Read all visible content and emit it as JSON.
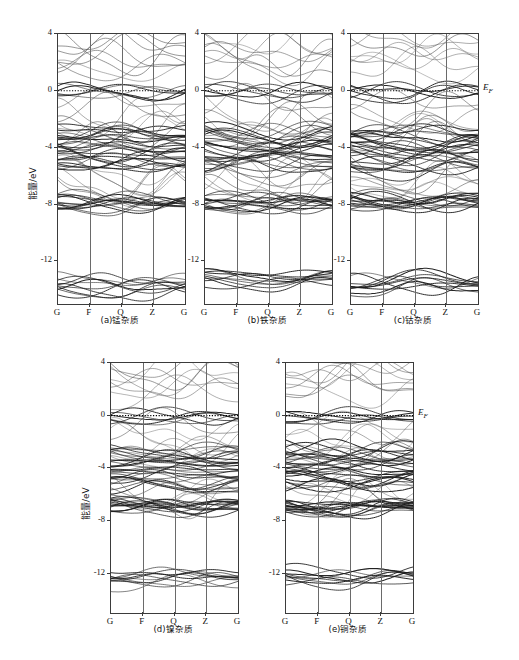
{
  "figure": {
    "ylabel": "能量/eV",
    "fermi_label_text": "E",
    "fermi_label_sub": "F",
    "yticks": [
      "4",
      "0",
      "-4",
      "-8",
      "-12"
    ],
    "xticks": [
      "G",
      "F",
      "Q",
      "Z",
      "G"
    ]
  },
  "panels": [
    {
      "id": "a",
      "caption": "(a)锰杂质",
      "show_yaxis": true,
      "show_ef": false
    },
    {
      "id": "b",
      "caption": "(b)铁杂质",
      "show_yaxis": true,
      "show_ef": false
    },
    {
      "id": "c",
      "caption": "(c)钴杂质",
      "show_yaxis": true,
      "show_ef": true
    },
    {
      "id": "d",
      "caption": "(d)镍杂质",
      "show_yaxis": true,
      "show_ef": false
    },
    {
      "id": "e",
      "caption": "(e)铜杂质",
      "show_yaxis": true,
      "show_ef": true
    }
  ],
  "chart_data": {
    "type": "line",
    "title": "",
    "xlabel": "",
    "ylabel": "能量/eV",
    "ylim": [
      -15,
      4
    ],
    "yticks": [
      4,
      0,
      -4,
      -8,
      -12
    ],
    "x": [
      "G",
      "F",
      "Q",
      "Z",
      "G"
    ],
    "xlim": [
      0,
      4
    ],
    "grid": "vertical-only",
    "legend": "none",
    "annotations": [
      {
        "text": "E_F",
        "y": 0,
        "note": "Fermi level marked by dotted horizontal line at E = 0 eV"
      }
    ],
    "panels": [
      {
        "name": "(a)锰杂质",
        "dopant": "Mn",
        "band_groups": [
          {
            "label": "conduction-dispersive",
            "emin": 1.4,
            "emax": 3.6,
            "n_bands": 8
          },
          {
            "label": "fermi-flat-impurity",
            "emin": -0.15,
            "emax": 0.1,
            "n_bands": 6
          },
          {
            "label": "shallow-acceptor",
            "emin": -1.2,
            "emax": -0.7,
            "n_bands": 2
          },
          {
            "label": "valence-upper",
            "emin": -3.2,
            "emax": -1.9,
            "n_bands": 6
          },
          {
            "label": "valence-main-dense",
            "emin": -5.4,
            "emax": -2.6,
            "n_bands": 26
          },
          {
            "label": "valence-lower",
            "emin": -6.8,
            "emax": -5.6,
            "n_bands": 6
          },
          {
            "label": "semicore-flat",
            "emin": -8.1,
            "emax": -7.6,
            "n_bands": 14
          },
          {
            "label": "deep-core",
            "emin": -14.2,
            "emax": -13.2,
            "n_bands": 10
          }
        ]
      },
      {
        "name": "(b)铁杂质",
        "dopant": "Fe",
        "band_groups": [
          {
            "label": "conduction-dispersive",
            "emin": 1.5,
            "emax": 3.7,
            "n_bands": 8
          },
          {
            "label": "fermi-flat-impurity",
            "emin": -0.2,
            "emax": 0.1,
            "n_bands": 6
          },
          {
            "label": "shallow-acceptor",
            "emin": -1.3,
            "emax": -0.8,
            "n_bands": 2
          },
          {
            "label": "valence-upper",
            "emin": -3.3,
            "emax": -2.0,
            "n_bands": 6
          },
          {
            "label": "valence-main-dense",
            "emin": -5.5,
            "emax": -2.7,
            "n_bands": 26
          },
          {
            "label": "valence-lower",
            "emin": -6.9,
            "emax": -5.7,
            "n_bands": 6
          },
          {
            "label": "semicore-flat",
            "emin": -8.2,
            "emax": -7.5,
            "n_bands": 14
          },
          {
            "label": "deep-core",
            "emin": -13.6,
            "emax": -12.8,
            "n_bands": 10
          }
        ]
      },
      {
        "name": "(c)钴杂质",
        "dopant": "Co",
        "band_groups": [
          {
            "label": "conduction-dispersive",
            "emin": 1.6,
            "emax": 3.9,
            "n_bands": 8
          },
          {
            "label": "fermi-flat-impurity",
            "emin": -0.2,
            "emax": 0.15,
            "n_bands": 6
          },
          {
            "label": "shallow-acceptor",
            "emin": -1.3,
            "emax": -0.8,
            "n_bands": 2
          },
          {
            "label": "valence-upper",
            "emin": -3.4,
            "emax": -2.0,
            "n_bands": 6
          },
          {
            "label": "valence-main-dense",
            "emin": -5.6,
            "emax": -2.7,
            "n_bands": 26
          },
          {
            "label": "valence-lower",
            "emin": -7.0,
            "emax": -5.8,
            "n_bands": 6
          },
          {
            "label": "semicore-flat",
            "emin": -8.1,
            "emax": -7.5,
            "n_bands": 14
          },
          {
            "label": "deep-core",
            "emin": -13.9,
            "emax": -13.1,
            "n_bands": 10
          }
        ]
      },
      {
        "name": "(d)镍杂质",
        "dopant": "Ni",
        "band_groups": [
          {
            "label": "conduction-dispersive",
            "emin": 1.8,
            "emax": 3.9,
            "n_bands": 8
          },
          {
            "label": "fermi-flat-impurity",
            "emin": -0.25,
            "emax": 0.05,
            "n_bands": 6
          },
          {
            "label": "shallow-acceptor",
            "emin": -1.1,
            "emax": -0.7,
            "n_bands": 2
          },
          {
            "label": "valence-upper",
            "emin": -3.2,
            "emax": -1.8,
            "n_bands": 6
          },
          {
            "label": "valence-main-dense",
            "emin": -5.5,
            "emax": -2.5,
            "n_bands": 26
          },
          {
            "label": "valence-lower",
            "emin": -6.6,
            "emax": -5.7,
            "n_bands": 6
          },
          {
            "label": "semicore-flat",
            "emin": -7.1,
            "emax": -6.6,
            "n_bands": 14
          },
          {
            "label": "deep-core",
            "emin": -12.7,
            "emax": -11.9,
            "n_bands": 10
          }
        ]
      },
      {
        "name": "(e)铜杂质",
        "dopant": "Cu",
        "band_groups": [
          {
            "label": "conduction-dispersive",
            "emin": 1.9,
            "emax": 4.0,
            "n_bands": 8
          },
          {
            "label": "fermi-flat-impurity",
            "emin": -0.3,
            "emax": 0.1,
            "n_bands": 6
          },
          {
            "label": "shallow-acceptor",
            "emin": -1.0,
            "emax": -0.6,
            "n_bands": 2
          },
          {
            "label": "valence-upper",
            "emin": -3.1,
            "emax": -1.7,
            "n_bands": 6
          },
          {
            "label": "valence-main-dense",
            "emin": -5.4,
            "emax": -2.4,
            "n_bands": 26
          },
          {
            "label": "valence-lower",
            "emin": -6.5,
            "emax": -5.6,
            "n_bands": 6
          },
          {
            "label": "semicore-flat",
            "emin": -7.2,
            "emax": -6.7,
            "n_bands": 14
          },
          {
            "label": "deep-core",
            "emin": -12.6,
            "emax": -11.8,
            "n_bands": 10
          }
        ]
      }
    ]
  }
}
